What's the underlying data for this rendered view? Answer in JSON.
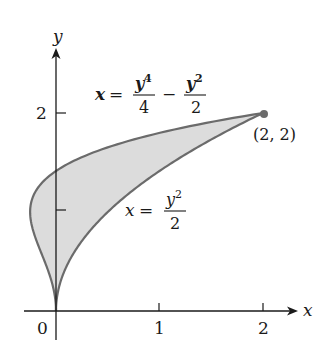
{
  "figure": {
    "type": "region-between-curves",
    "axes": {
      "x_label": "x",
      "y_label": "y",
      "x_ticks": [
        {
          "value": 0,
          "label": "0"
        },
        {
          "value": 1,
          "label": "1"
        },
        {
          "value": 2,
          "label": "2"
        }
      ],
      "y_ticks": [
        {
          "value": 1,
          "label": ""
        },
        {
          "value": 2,
          "label": "2"
        }
      ],
      "origin_label": "0"
    },
    "curves": [
      {
        "name": "upper-left-curve",
        "equation": "x = y^4/4 - y^2/2",
        "label_lhs": "x",
        "label_eq": "=",
        "label_frac1_num": "y",
        "label_frac1_num_exp": "4",
        "label_frac1_den": "4",
        "label_minus": "−",
        "label_frac2_num": "y",
        "label_frac2_num_exp": "2",
        "label_frac2_den": "2"
      },
      {
        "name": "lower-right-curve",
        "equation": "x = y^2/2",
        "label_lhs": "x",
        "label_eq": "=",
        "label_frac_num": "y",
        "label_frac_num_exp": "2",
        "label_frac_den": "2"
      }
    ],
    "intersection_point": {
      "x": 2,
      "y": 2,
      "label": "(2, 2)"
    },
    "y_range": [
      0,
      2
    ],
    "colors": {
      "fill": "#dcdcdc",
      "curve_stroke": "#6b6b6b",
      "axis": "#1a1a1a",
      "point": "#6b6b6b"
    }
  }
}
